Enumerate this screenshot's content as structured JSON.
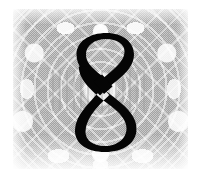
{
  "page": {
    "kind": "chapter-opener",
    "background_color": "#ffffff",
    "width": 205,
    "height": 187
  },
  "plate": {
    "name": "ornamental-texture-plate",
    "description": "halftone-dithered arabesque ornament background",
    "base_color": "#c9c9c9",
    "highlight_color": "#ffffff",
    "shadow_color": "#787878",
    "x": 13,
    "y": 9,
    "width": 175,
    "height": 160
  },
  "numeral": {
    "label": "8",
    "color": "#050505",
    "role": "chapter-number"
  }
}
